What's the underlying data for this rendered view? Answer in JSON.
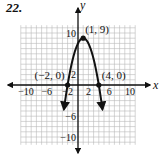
{
  "problem_number": "22.",
  "chart_data": {
    "type": "line",
    "title": "",
    "xlabel": "x",
    "ylabel": "y",
    "xlim": [
      -11,
      11
    ],
    "ylim": [
      -11,
      11
    ],
    "grid": true,
    "grid_step": 1,
    "x_ticks": [
      -10,
      -6,
      -2,
      2,
      6,
      10
    ],
    "x_tick_labels": [
      "−10",
      "−6",
      "−2",
      "2",
      "6",
      "10"
    ],
    "y_ticks": [
      10,
      2,
      -6,
      -10
    ],
    "y_tick_labels": [
      "10",
      "2",
      "−6",
      "−10"
    ],
    "series": [
      {
        "name": "parabola",
        "equation": "y = -(x - 1)^2 + 9",
        "x": [
          -2.7,
          -2,
          -1,
          0,
          1,
          2,
          3,
          4,
          4.7
        ],
        "y": [
          -4.7,
          0,
          5,
          8,
          9,
          8,
          5,
          0,
          -4.7
        ],
        "arrows_at_ends": true
      }
    ],
    "points": [
      {
        "x": 1,
        "y": 9,
        "label": "(1, 9)"
      },
      {
        "x": -2,
        "y": 0,
        "label": "(−2, 0)"
      },
      {
        "x": 4,
        "y": 0,
        "label": "(4, 0)"
      }
    ],
    "colors": {
      "curve": "#111111",
      "grid": "#b8b8b8",
      "axis": "#111111"
    }
  }
}
